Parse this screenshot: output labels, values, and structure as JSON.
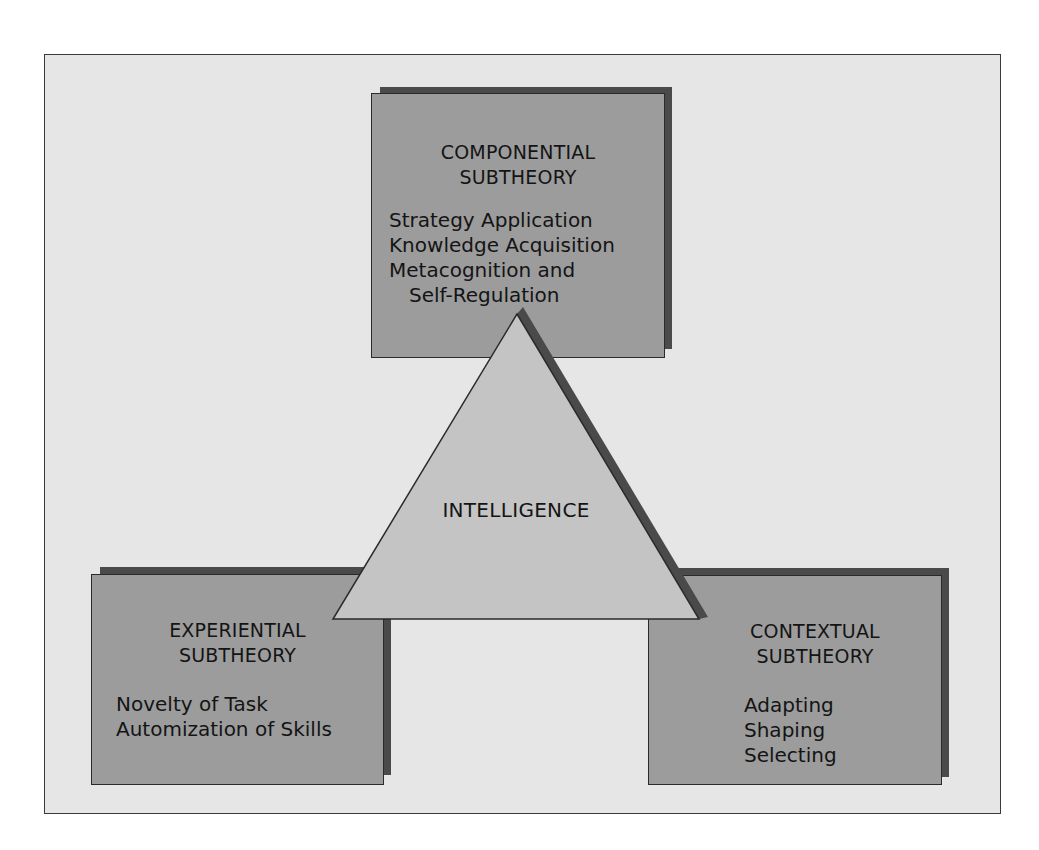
{
  "diagram": {
    "type": "triarchic-theory-of-intelligence",
    "center": {
      "label": "INTELLIGENCE",
      "shape": "triangle"
    },
    "boxes": [
      {
        "id": "componential",
        "position": "top",
        "title_line1": "COMPONENTIAL",
        "title_line2": "SUBTHEORY",
        "items": [
          "Strategy Application",
          "Knowledge Acquisition",
          "Metacognition and",
          "Self-Regulation"
        ]
      },
      {
        "id": "experiential",
        "position": "bottom-left",
        "title_line1": "EXPERIENTIAL",
        "title_line2": "SUBTHEORY",
        "items": [
          "Novelty of Task",
          "Automization of Skills"
        ]
      },
      {
        "id": "contextual",
        "position": "bottom-right",
        "title_line1": "CONTEXTUAL",
        "title_line2": "SUBTHEORY",
        "items": [
          "Adapting",
          "Shaping",
          "Selecting"
        ]
      }
    ],
    "colors": {
      "frame_background": "#e6e6e6",
      "box_fill": "#9c9c9c",
      "shadow": "#4a4a4a",
      "triangle_fill": "#c4c4c4",
      "stroke": "#2a2a2a"
    }
  }
}
